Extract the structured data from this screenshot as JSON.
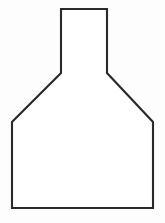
{
  "canvas": {
    "width": 165,
    "height": 223,
    "background_color": "#fdfdfd",
    "title": "Shape Outline"
  },
  "figure": {
    "name": "flask-outline",
    "stroke_color": "#2a2a2a",
    "fill_color": "#ffffff",
    "stroke_width": 2.1,
    "closed": true,
    "vertex_count": 10,
    "points": "61,9 107,9 107,73 153,122 153,208 12,208 12,122 61,73",
    "vertices": [
      {
        "label": "neck-top-left",
        "x": 61,
        "y": 9
      },
      {
        "label": "neck-top-right",
        "x": 107,
        "y": 9
      },
      {
        "label": "neck-base-right",
        "x": 107,
        "y": 73
      },
      {
        "label": "shoulder-right",
        "x": 153,
        "y": 122
      },
      {
        "label": "body-bottom-right",
        "x": 153,
        "y": 208
      },
      {
        "label": "body-bottom-left",
        "x": 12,
        "y": 208
      },
      {
        "label": "shoulder-left",
        "x": 12,
        "y": 122
      },
      {
        "label": "neck-base-left",
        "x": 61,
        "y": 73
      }
    ],
    "segments": [
      {
        "name": "neck-top-edge",
        "from": "neck-top-left",
        "to": "neck-top-right",
        "orientation": "horizontal"
      },
      {
        "name": "neck-right-wall",
        "from": "neck-top-right",
        "to": "neck-base-right",
        "orientation": "vertical"
      },
      {
        "name": "shoulder-right-diagonal",
        "from": "neck-base-right",
        "to": "shoulder-right",
        "orientation": "diagonal"
      },
      {
        "name": "body-right-wall",
        "from": "shoulder-right",
        "to": "body-bottom-right",
        "orientation": "vertical"
      },
      {
        "name": "body-bottom-edge",
        "from": "body-bottom-right",
        "to": "body-bottom-left",
        "orientation": "horizontal"
      },
      {
        "name": "body-left-wall",
        "from": "body-bottom-left",
        "to": "shoulder-left",
        "orientation": "vertical"
      },
      {
        "name": "shoulder-left-diagonal",
        "from": "shoulder-left",
        "to": "neck-base-left",
        "orientation": "diagonal"
      },
      {
        "name": "neck-left-wall",
        "from": "neck-base-left",
        "to": "neck-top-left",
        "orientation": "vertical"
      }
    ]
  }
}
